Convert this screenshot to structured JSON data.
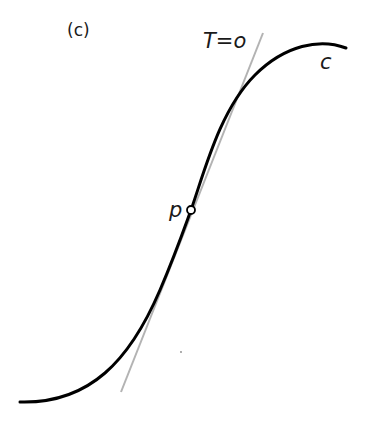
{
  "figure": {
    "panel_label": "(c)",
    "tangent_label": "T=o",
    "curve_label": "c",
    "point_label": "p"
  },
  "colors": {
    "curve": "#000000",
    "tangent": "#b3b3b3",
    "background": "#ffffff"
  },
  "geometry": {
    "point_p": [
      191,
      210
    ],
    "tangent_start": [
      263,
      33
    ],
    "tangent_end": [
      121,
      392
    ]
  }
}
